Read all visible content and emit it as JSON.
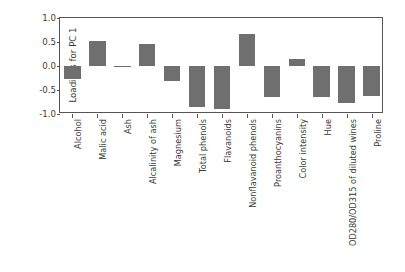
{
  "chart_data": {
    "type": "bar",
    "title": "",
    "xlabel": "",
    "ylabel": "Loadings for PC 1",
    "ylim": [
      -1.0,
      1.0
    ],
    "yticks": [
      "1.0",
      "0.5",
      "0.0",
      "-0.5",
      "-1.0"
    ],
    "ytick_values": [
      1.0,
      0.5,
      0.0,
      -0.5,
      -1.0
    ],
    "grid": false,
    "legend": "none",
    "bar_color": "#6f6f6f",
    "categories": [
      "Alcohol",
      "Malic acid",
      "Ash",
      "Alcalinity of ash",
      "Magnesium",
      "Total phenols",
      "Flavanoids",
      "Nonflavanoid phenols",
      "Proanthocyanins",
      "Color intensity",
      "Hue",
      "OD280/OD315 of diluted wines",
      "Proline"
    ],
    "values": [
      -0.27,
      0.52,
      -0.03,
      0.45,
      -0.32,
      -0.85,
      -0.89,
      0.67,
      -0.65,
      0.15,
      -0.65,
      -0.77,
      -0.62
    ]
  }
}
